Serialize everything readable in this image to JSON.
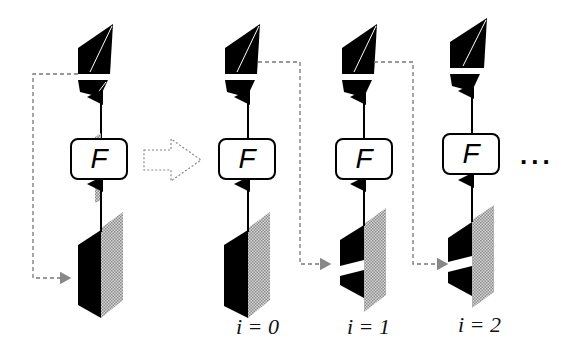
{
  "diagram": {
    "function_label": "F",
    "left_panel": {
      "name": "single-step",
      "function_box": "F"
    },
    "transform_arrow": "hollow-dashed-right-arrow",
    "iterations": [
      {
        "label": "i = 0",
        "function_box": "F"
      },
      {
        "label": "i = 1",
        "function_box": "F"
      },
      {
        "label": "i = 2",
        "function_box": "F"
      }
    ],
    "continuation": "...",
    "colors": {
      "foreground": "#000000",
      "dashed_line": "#777777",
      "texture_gray": "#9a9a9a",
      "background": "#ffffff"
    }
  }
}
